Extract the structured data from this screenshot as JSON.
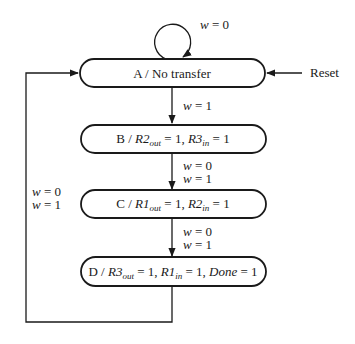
{
  "diagram": {
    "type": "finite-state-machine",
    "colors": {
      "stroke": "#1a1a1a",
      "background": "#ffffff"
    },
    "states": [
      {
        "id": "A",
        "name": "A",
        "output_text": "No transfer",
        "outputs": []
      },
      {
        "id": "B",
        "name": "B",
        "outputs": [
          {
            "signal": "R2",
            "sub": "out",
            "value": "1"
          },
          {
            "signal": "R3",
            "sub": "in",
            "value": "1"
          }
        ]
      },
      {
        "id": "C",
        "name": "C",
        "outputs": [
          {
            "signal": "R1",
            "sub": "out",
            "value": "1"
          },
          {
            "signal": "R2",
            "sub": "in",
            "value": "1"
          }
        ]
      },
      {
        "id": "D",
        "name": "D",
        "outputs": [
          {
            "signal": "R3",
            "sub": "out",
            "value": "1"
          },
          {
            "signal": "R1",
            "sub": "in",
            "value": "1"
          },
          {
            "signal": "Done",
            "sub": "",
            "value": "1"
          }
        ]
      }
    ],
    "transitions": [
      {
        "from": "A",
        "to": "A",
        "conditions": [
          "w = 0"
        ]
      },
      {
        "from": "A",
        "to": "B",
        "conditions": [
          "w = 1"
        ]
      },
      {
        "from": "B",
        "to": "C",
        "conditions": [
          "w = 0",
          "w = 1"
        ]
      },
      {
        "from": "C",
        "to": "D",
        "conditions": [
          "w = 0",
          "w = 1"
        ]
      },
      {
        "from": "D",
        "to": "A",
        "conditions": [
          "w = 0",
          "w = 1"
        ]
      }
    ],
    "reset": {
      "label": "Reset",
      "target": "A"
    }
  },
  "labels": {
    "stateA": "A / No transfer",
    "sep": " / ",
    "eq1": " = 1, ",
    "eq1end": " = 1",
    "B": "B",
    "C": "C",
    "D": "D",
    "R1": "R1",
    "R2": "R2",
    "R3": "R3",
    "Done": "Done",
    "out": "out",
    "in": "in",
    "w": "w",
    "eq0": " = 0",
    "eq1w": " = 1",
    "reset": "Reset"
  }
}
